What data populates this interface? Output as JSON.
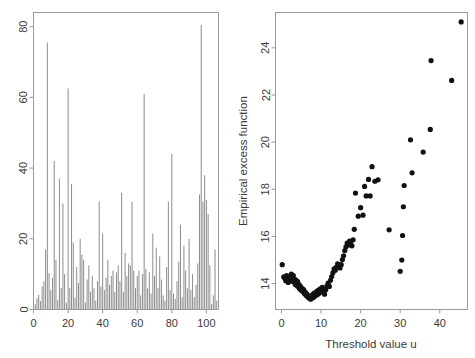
{
  "figure": {
    "width": 475,
    "height": 358,
    "background": "#ffffff",
    "panels": 2
  },
  "chart_data": [
    {
      "id": "left-panel",
      "type": "bar",
      "title": "",
      "subtitle": "",
      "xlabel": "",
      "ylabel": "",
      "xlim": [
        0,
        107
      ],
      "ylim": [
        0,
        84
      ],
      "xticks": [
        0,
        20,
        40,
        60,
        80,
        100
      ],
      "yticks": [
        0,
        20,
        40,
        60,
        80
      ],
      "xticklabels": [
        "0",
        "20",
        "40",
        "60",
        "80",
        "100"
      ],
      "yticklabels": [
        "0",
        "20",
        "40",
        "60",
        "80"
      ],
      "grid": false,
      "legend": null,
      "series_color": "#8c8c8c",
      "annotations": [],
      "x": [
        1,
        2,
        3,
        4,
        5,
        6,
        7,
        8,
        9,
        10,
        11,
        12,
        13,
        14,
        15,
        16,
        17,
        18,
        19,
        20,
        21,
        22,
        23,
        24,
        25,
        26,
        27,
        28,
        29,
        30,
        31,
        32,
        33,
        34,
        35,
        36,
        37,
        38,
        39,
        40,
        41,
        42,
        43,
        44,
        45,
        46,
        47,
        48,
        49,
        50,
        51,
        52,
        53,
        54,
        55,
        56,
        57,
        58,
        59,
        60,
        61,
        62,
        63,
        64,
        65,
        66,
        67,
        68,
        69,
        70,
        71,
        72,
        73,
        74,
        75,
        76,
        77,
        78,
        79,
        80,
        81,
        82,
        83,
        84,
        85,
        86,
        87,
        88,
        89,
        90,
        91,
        92,
        93,
        94,
        95,
        96,
        97,
        98,
        99,
        100,
        101,
        102,
        103,
        104,
        105,
        106
      ],
      "values": [
        1.5,
        3.2,
        4.1,
        2.4,
        6.5,
        8.0,
        17.0,
        75.5,
        10.3,
        5.5,
        9.0,
        42.0,
        14.0,
        2.6,
        37.0,
        6.1,
        30.0,
        10.0,
        1.9,
        62.5,
        6.0,
        35.5,
        19.0,
        3.4,
        12.0,
        7.5,
        20.0,
        15.5,
        14.0,
        2.0,
        8.5,
        12.5,
        5.0,
        9.5,
        6.0,
        2.5,
        8.0,
        30.5,
        6.5,
        21.5,
        5.5,
        9.0,
        14.0,
        7.0,
        9.5,
        11.0,
        5.0,
        10.5,
        12.5,
        8.0,
        33.0,
        5.0,
        16.0,
        9.5,
        13.0,
        12.5,
        30.5,
        11.0,
        6.0,
        9.5,
        11.0,
        4.0,
        10.0,
        61.0,
        11.5,
        6.0,
        10.5,
        4.5,
        21.5,
        9.5,
        17.5,
        6.0,
        15.0,
        8.5,
        4.0,
        2.5,
        12.0,
        30.5,
        5.5,
        44.0,
        4.5,
        3.0,
        8.0,
        13.5,
        24.0,
        3.5,
        18.0,
        11.0,
        6.0,
        20.0,
        5.5,
        10.0,
        3.5,
        7.0,
        13.0,
        32.5,
        80.5,
        30.5,
        38.0,
        31.0,
        27.0,
        12.5,
        1.5,
        4.0,
        17.0,
        2.5
      ]
    },
    {
      "id": "right-panel",
      "type": "scatter",
      "title": "",
      "subtitle": "",
      "xlabel": "Threshold value u",
      "ylabel": "Empirical excess function",
      "xlim": [
        -1.5,
        47
      ],
      "ylim": [
        12.9,
        25.5
      ],
      "xticks": [
        0,
        10,
        20,
        30,
        40
      ],
      "yticks": [
        14,
        16,
        18,
        20,
        22,
        24
      ],
      "xticklabels": [
        "0",
        "10",
        "20",
        "30",
        "40"
      ],
      "yticklabels": [
        "14",
        "16",
        "18",
        "20",
        "22",
        "24"
      ],
      "grid": false,
      "legend": null,
      "marker_color": "#111111",
      "marker_size": 2.6,
      "annotations": [],
      "points": [
        [
          0.2,
          14.8
        ],
        [
          0.6,
          14.28
        ],
        [
          0.9,
          14.22
        ],
        [
          1.1,
          14.12
        ],
        [
          1.3,
          14.34
        ],
        [
          1.5,
          14.18
        ],
        [
          1.7,
          14.05
        ],
        [
          1.9,
          14.24
        ],
        [
          2.1,
          14.3
        ],
        [
          2.3,
          14.1
        ],
        [
          2.5,
          14.4
        ],
        [
          2.6,
          14.26
        ],
        [
          2.8,
          14.12
        ],
        [
          3.0,
          14.34
        ],
        [
          3.1,
          14.2
        ],
        [
          3.3,
          14.06
        ],
        [
          3.5,
          13.96
        ],
        [
          3.6,
          14.16
        ],
        [
          3.8,
          14.02
        ],
        [
          4.0,
          13.9
        ],
        [
          4.1,
          14.08
        ],
        [
          4.3,
          13.86
        ],
        [
          4.5,
          13.95
        ],
        [
          4.6,
          13.78
        ],
        [
          4.8,
          13.88
        ],
        [
          5.0,
          13.72
        ],
        [
          5.2,
          13.8
        ],
        [
          5.4,
          13.66
        ],
        [
          5.6,
          13.74
        ],
        [
          5.8,
          13.58
        ],
        [
          6.0,
          13.64
        ],
        [
          6.2,
          13.5
        ],
        [
          6.4,
          13.56
        ],
        [
          6.6,
          13.44
        ],
        [
          6.8,
          13.48
        ],
        [
          7.0,
          13.38
        ],
        [
          7.2,
          13.46
        ],
        [
          7.4,
          13.34
        ],
        [
          7.6,
          13.42
        ],
        [
          7.8,
          13.52
        ],
        [
          8.0,
          13.4
        ],
        [
          8.2,
          13.58
        ],
        [
          8.4,
          13.46
        ],
        [
          8.6,
          13.62
        ],
        [
          8.8,
          13.5
        ],
        [
          9.0,
          13.68
        ],
        [
          9.2,
          13.55
        ],
        [
          9.4,
          13.72
        ],
        [
          9.6,
          13.6
        ],
        [
          9.8,
          13.78
        ],
        [
          10.0,
          13.66
        ],
        [
          10.3,
          13.84
        ],
        [
          10.6,
          13.7
        ],
        [
          10.9,
          13.55
        ],
        [
          11.2,
          13.74
        ],
        [
          11.5,
          13.9
        ],
        [
          11.8,
          14.02
        ],
        [
          12.1,
          13.88
        ],
        [
          12.4,
          14.14
        ],
        [
          12.7,
          14.3
        ],
        [
          13.0,
          14.46
        ],
        [
          13.3,
          14.62
        ],
        [
          13.6,
          14.56
        ],
        [
          13.9,
          14.7
        ],
        [
          14.2,
          14.84
        ],
        [
          14.5,
          14.74
        ],
        [
          14.8,
          14.66
        ],
        [
          15.1,
          14.8
        ],
        [
          15.4,
          15.02
        ],
        [
          15.7,
          15.18
        ],
        [
          16.0,
          15.4
        ],
        [
          16.3,
          15.56
        ],
        [
          16.6,
          15.72
        ],
        [
          16.9,
          15.64
        ],
        [
          17.2,
          15.8
        ],
        [
          17.5,
          15.72
        ],
        [
          17.8,
          15.6
        ],
        [
          18.1,
          15.86
        ],
        [
          18.4,
          16.3
        ],
        [
          18.7,
          17.84
        ],
        [
          19.4,
          16.86
        ],
        [
          20.0,
          17.22
        ],
        [
          20.6,
          16.9
        ],
        [
          21.0,
          18.12
        ],
        [
          21.4,
          17.72
        ],
        [
          22.0,
          18.42
        ],
        [
          22.4,
          17.72
        ],
        [
          22.9,
          18.96
        ],
        [
          23.6,
          18.34
        ],
        [
          24.4,
          18.4
        ],
        [
          27.2,
          16.28
        ],
        [
          30.0,
          14.52
        ],
        [
          30.4,
          15.0
        ],
        [
          30.6,
          16.04
        ],
        [
          30.8,
          17.26
        ],
        [
          31.0,
          18.16
        ],
        [
          32.6,
          20.1
        ],
        [
          33.0,
          18.7
        ],
        [
          35.8,
          19.58
        ],
        [
          37.6,
          20.54
        ],
        [
          37.8,
          23.46
        ],
        [
          43.0,
          22.62
        ],
        [
          45.4,
          25.1
        ]
      ]
    }
  ],
  "axes": {
    "left": {
      "y_tick_labels": [
        "80",
        "60",
        "40",
        "20",
        "0"
      ],
      "x_tick_labels": [
        "0",
        "20",
        "40",
        "60",
        "80",
        "100"
      ]
    },
    "right": {
      "y_tick_labels": [
        "24",
        "22",
        "20",
        "18",
        "16",
        "14"
      ],
      "x_tick_labels": [
        "0",
        "10",
        "20",
        "30",
        "40"
      ],
      "x_axis_title": "Threshold value u",
      "y_axis_title": "Empirical excess function"
    }
  }
}
